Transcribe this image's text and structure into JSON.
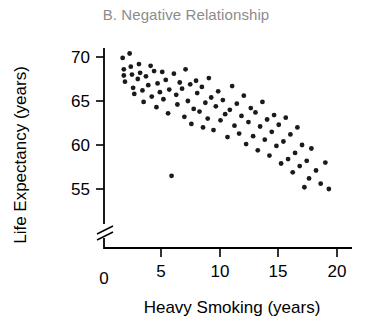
{
  "chart_data": {
    "type": "scatter",
    "title": "B. Negative Relationship",
    "xlabel": "Heavy Smoking (years)",
    "ylabel": "Life Expectancy (years)",
    "xticks": [
      "0",
      "5",
      "10",
      "15",
      "20"
    ],
    "xtick_values": [
      0,
      5,
      10,
      15,
      20
    ],
    "yticks": [
      "55",
      "60",
      "65",
      "70"
    ],
    "ytick_values": [
      55,
      60,
      65,
      70
    ],
    "xlim": [
      0,
      21
    ],
    "ylim": [
      53,
      71.5
    ],
    "grid": false,
    "legend": null,
    "axis_break": "y-axis break between 0 and 55",
    "marker": "filled-circle",
    "marker_color": "#1a1a1a",
    "title_color": "#8c8c8c",
    "axis_color": "#000000",
    "points": [
      [
        1.6,
        69.9
      ],
      [
        1.7,
        68.6
      ],
      [
        1.7,
        67.9
      ],
      [
        1.8,
        67.2
      ],
      [
        2.2,
        70.4
      ],
      [
        2.3,
        68.9
      ],
      [
        2.4,
        68.0
      ],
      [
        2.5,
        66.5
      ],
      [
        2.6,
        65.8
      ],
      [
        2.9,
        67.5
      ],
      [
        3.0,
        69.2
      ],
      [
        3.1,
        68.2
      ],
      [
        3.3,
        66.2
      ],
      [
        3.4,
        64.9
      ],
      [
        3.6,
        67.8
      ],
      [
        3.8,
        66.8
      ],
      [
        4.0,
        69.0
      ],
      [
        4.1,
        65.5
      ],
      [
        4.3,
        68.4
      ],
      [
        4.5,
        64.3
      ],
      [
        4.6,
        67.0
      ],
      [
        4.8,
        66.0
      ],
      [
        5.0,
        68.3
      ],
      [
        5.1,
        65.2
      ],
      [
        5.3,
        67.4
      ],
      [
        5.5,
        63.6
      ],
      [
        5.6,
        66.3
      ],
      [
        5.8,
        56.5
      ],
      [
        6.0,
        68.1
      ],
      [
        6.2,
        65.7
      ],
      [
        6.3,
        64.6
      ],
      [
        6.5,
        67.1
      ],
      [
        6.7,
        66.4
      ],
      [
        6.9,
        63.2
      ],
      [
        7.0,
        68.6
      ],
      [
        7.2,
        65.0
      ],
      [
        7.4,
        66.9
      ],
      [
        7.5,
        62.4
      ],
      [
        7.7,
        64.1
      ],
      [
        7.9,
        67.3
      ],
      [
        8.0,
        65.9
      ],
      [
        8.2,
        63.8
      ],
      [
        8.4,
        66.6
      ],
      [
        8.5,
        62.0
      ],
      [
        8.7,
        64.8
      ],
      [
        8.9,
        63.0
      ],
      [
        9.0,
        67.6
      ],
      [
        9.2,
        65.4
      ],
      [
        9.4,
        61.7
      ],
      [
        9.6,
        64.4
      ],
      [
        9.8,
        66.1
      ],
      [
        10.0,
        62.8
      ],
      [
        10.2,
        65.1
      ],
      [
        10.4,
        63.5
      ],
      [
        10.6,
        60.9
      ],
      [
        10.8,
        64.0
      ],
      [
        11.0,
        66.7
      ],
      [
        11.2,
        62.2
      ],
      [
        11.4,
        64.7
      ],
      [
        11.6,
        61.3
      ],
      [
        11.8,
        63.3
      ],
      [
        12.0,
        65.6
      ],
      [
        12.2,
        60.1
      ],
      [
        12.4,
        62.6
      ],
      [
        12.6,
        64.2
      ],
      [
        12.8,
        61.0
      ],
      [
        13.0,
        63.7
      ],
      [
        13.2,
        59.4
      ],
      [
        13.4,
        62.1
      ],
      [
        13.6,
        64.9
      ],
      [
        13.8,
        60.6
      ],
      [
        14.0,
        62.9
      ],
      [
        14.2,
        58.8
      ],
      [
        14.4,
        61.5
      ],
      [
        14.6,
        63.4
      ],
      [
        14.8,
        59.9
      ],
      [
        15.0,
        62.3
      ],
      [
        15.2,
        57.9
      ],
      [
        15.4,
        60.4
      ],
      [
        15.6,
        63.1
      ],
      [
        15.8,
        58.4
      ],
      [
        16.0,
        61.2
      ],
      [
        16.2,
        56.9
      ],
      [
        16.4,
        59.1
      ],
      [
        16.6,
        62.0
      ],
      [
        16.8,
        57.6
      ],
      [
        17.0,
        60.0
      ],
      [
        17.2,
        55.2
      ],
      [
        17.4,
        58.2
      ],
      [
        17.6,
        56.2
      ],
      [
        17.8,
        59.6
      ],
      [
        18.2,
        57.1
      ],
      [
        18.6,
        55.6
      ],
      [
        19.0,
        58.0
      ],
      [
        19.3,
        55.0
      ]
    ]
  }
}
